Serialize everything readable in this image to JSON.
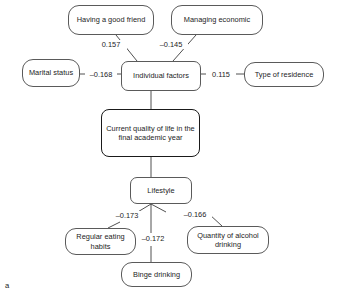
{
  "figure": {
    "panel_label": "a",
    "type": "path-diagram",
    "colors": {
      "background": "#ffffff",
      "node_border": "#5a5a5a",
      "emphasis_border": "#1a1a1a",
      "edge_line": "#3c3c3c",
      "text": "#1c1c1c"
    }
  },
  "nodes": [
    {
      "id": "having-a-good-friend",
      "label": "Having a good friend",
      "shape": "pill",
      "emphasis": false,
      "x": 68,
      "y": 5,
      "w": 86,
      "h": 30
    },
    {
      "id": "managing-economic",
      "label": "Managing economic",
      "shape": "pill",
      "emphasis": false,
      "x": 171,
      "y": 5,
      "w": 92,
      "h": 30
    },
    {
      "id": "marital-status",
      "label": "Marital status",
      "shape": "pill",
      "emphasis": false,
      "x": 22,
      "y": 59,
      "w": 58,
      "h": 28
    },
    {
      "id": "individual-factors",
      "label": "Individual factors",
      "shape": "soft",
      "emphasis": false,
      "x": 121,
      "y": 61,
      "w": 80,
      "h": 30
    },
    {
      "id": "type-of-residence",
      "label": "Type of residence",
      "shape": "pill",
      "emphasis": false,
      "x": 244,
      "y": 62,
      "w": 80,
      "h": 25
    },
    {
      "id": "current-quality-of-life",
      "label": "Current quality of life in the final academic year",
      "shape": "soft",
      "emphasis": true,
      "x": 101,
      "y": 109,
      "w": 99,
      "h": 48
    },
    {
      "id": "lifestyle",
      "label": "Lifestyle",
      "shape": "soft",
      "emphasis": false,
      "x": 130,
      "y": 177,
      "w": 62,
      "h": 27
    },
    {
      "id": "regular-eating-habits",
      "label": "Regular eating habits",
      "shape": "pill",
      "emphasis": false,
      "x": 65,
      "y": 228,
      "w": 71,
      "h": 27
    },
    {
      "id": "quantity-of-alcohol-drinking",
      "label": "Quantity of alcohol drinking",
      "shape": "pill",
      "emphasis": false,
      "x": 187,
      "y": 226,
      "w": 82,
      "h": 28
    },
    {
      "id": "binge-drinking",
      "label": "Binge drinking",
      "shape": "pill",
      "emphasis": false,
      "x": 121,
      "y": 262,
      "w": 71,
      "h": 25
    }
  ],
  "edges": [
    {
      "id": "friend-to-individual",
      "from": "having-a-good-friend",
      "to": "individual-factors",
      "coefficient": "0.157",
      "label_x": 110,
      "label_y": 40
    },
    {
      "id": "economic-to-individual",
      "from": "managing-economic",
      "to": "individual-factors",
      "coefficient": "–0.145",
      "label_x": 169,
      "label_y": 40
    },
    {
      "id": "marital-to-individual",
      "from": "marital-status",
      "to": "individual-factors",
      "coefficient": "–0.168",
      "label_x": 85,
      "label_y": 71
    },
    {
      "id": "individual-to-residence",
      "from": "individual-factors",
      "to": "type-of-residence",
      "coefficient": "0.115",
      "label_x": 206,
      "label_y": 71
    },
    {
      "id": "individual-to-quality",
      "from": "individual-factors",
      "to": "current-quality-of-life",
      "coefficient": "",
      "label_x": 0,
      "label_y": 0
    },
    {
      "id": "quality-to-lifestyle",
      "from": "current-quality-of-life",
      "to": "lifestyle",
      "coefficient": "",
      "label_x": 0,
      "label_y": 0
    },
    {
      "id": "lifestyle-to-eating",
      "from": "lifestyle",
      "to": "regular-eating-habits",
      "coefficient": "–0.173",
      "label_x": 110,
      "label_y": 212
    },
    {
      "id": "lifestyle-to-alcohol",
      "from": "lifestyle",
      "to": "quantity-of-alcohol-drinking",
      "coefficient": "–0.166",
      "label_x": 184,
      "label_y": 211
    },
    {
      "id": "lifestyle-to-binge",
      "from": "lifestyle",
      "to": "binge-drinking",
      "coefficient": "–0.172",
      "label_x": 146,
      "label_y": 239
    }
  ]
}
